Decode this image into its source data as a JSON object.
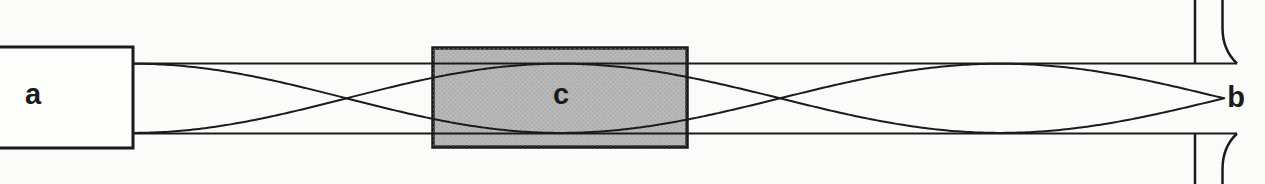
{
  "labels": {
    "a": "a",
    "b": "b",
    "c": "c"
  },
  "colors": {
    "paper": "#fbfbf9",
    "ink": "#1b1b1b",
    "source_box_fill": "#fdfdfc",
    "shade_fill": "#b9b9b9",
    "shade_dot": "#9c9c9c"
  },
  "diagram": {
    "canvas": {
      "width": 1265,
      "height": 184
    },
    "source_box": {
      "x": -6,
      "y": 47,
      "width": 139,
      "height": 101,
      "stroke_width": 3
    },
    "shaded_box": {
      "x": 433,
      "y": 48,
      "width": 254,
      "height": 99,
      "stroke_width": 3.5
    },
    "tube": {
      "x_start": 133,
      "x_end": 1237,
      "y_top": 63.5,
      "y_bottom": 133.5,
      "stroke_width": 2.2
    },
    "end_wall": {
      "x": 1195,
      "stroke_width": 2.5
    },
    "end_lip": {
      "x": 1222.5,
      "straight_len": 28,
      "stroke_width": 2.5
    },
    "wave": {
      "y_mid": 98.3,
      "amplitude": 34.6,
      "stroke_width": 2,
      "theta_profile": [
        [
          133,
          0
        ],
        [
          560,
          180
        ],
        [
          1000,
          360
        ],
        [
          1224,
          450
        ]
      ]
    },
    "label_positions": {
      "a": [
        33,
        104
      ],
      "c": [
        561,
        104
      ],
      "b": [
        1236,
        107
      ]
    }
  }
}
